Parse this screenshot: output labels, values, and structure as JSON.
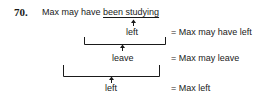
{
  "example": {
    "number": "70.",
    "sentence_prefix": "Max may have ",
    "sentence_underlined": "been studying",
    "levels": [
      {
        "word": "left",
        "gloss": "= Max may have left"
      },
      {
        "word": "leave",
        "gloss": "= Max may leave"
      },
      {
        "word": "left",
        "gloss": "= Max left"
      }
    ]
  }
}
